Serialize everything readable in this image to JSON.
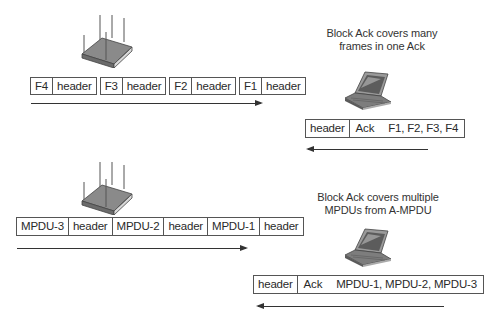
{
  "top_section": {
    "device_left": "access-point",
    "device_right": "laptop",
    "caption_line1": "Block Ack covers many",
    "caption_line2": "frames in one Ack",
    "data_frames": [
      {
        "payload": "F4",
        "header": "header"
      },
      {
        "payload": "F3",
        "header": "header"
      },
      {
        "payload": "F2",
        "header": "header"
      },
      {
        "payload": "F1",
        "header": "header"
      }
    ],
    "ack_frame": {
      "header": "header",
      "ack": "Ack",
      "covers": "F1, F2, F3, F4"
    },
    "data_direction": "right",
    "ack_direction": "left"
  },
  "bottom_section": {
    "device_left": "access-point",
    "device_right": "laptop",
    "caption_line1": "Block Ack covers multiple",
    "caption_line2": "MPDUs from A-MPDU",
    "ampdu": [
      {
        "payload": "MPDU-3",
        "header": "header"
      },
      {
        "payload": "MPDU-2",
        "header": "header"
      },
      {
        "payload": "MPDU-1",
        "header": "header"
      }
    ],
    "ack_frame": {
      "header": "header",
      "ack": "Ack",
      "covers": "MPDU-1, MPDU-2, MPDU-3"
    },
    "data_direction": "right",
    "ack_direction": "left"
  },
  "colors": {
    "line": "#333333",
    "border": "#555555",
    "device_body": "#8a8a8a"
  }
}
